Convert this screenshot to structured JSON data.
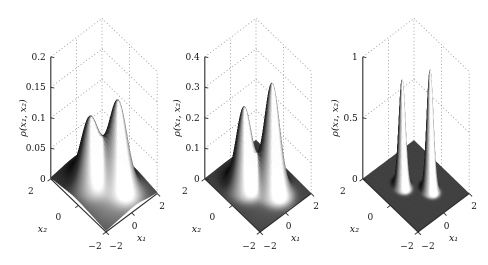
{
  "figure": {
    "background": "#ffffff",
    "panels": 3
  },
  "style": {
    "axis_color": "#2b2b2b",
    "grid_color": "#909090",
    "text_color": "#111111",
    "surface_highlight": "#ffffff",
    "surface_shadow": "#0d0d0d"
  },
  "chart_data": [
    {
      "type": "surface",
      "id": "panel-1",
      "z_axis": {
        "label": "ρ(x₁, x₂)",
        "min": 0,
        "max": 0.2,
        "ticks": [
          {
            "value": 0,
            "label": "0"
          },
          {
            "value": 0.05,
            "label": "0.05"
          },
          {
            "value": 0.1,
            "label": "0.1"
          },
          {
            "value": 0.15,
            "label": "0.15"
          },
          {
            "value": 0.2,
            "label": "0.2"
          }
        ]
      },
      "x1_axis": {
        "label": "x₁",
        "min": -2,
        "max": 2,
        "ticks": [
          {
            "value": -2,
            "label": "−2"
          },
          {
            "value": 0,
            "label": "0"
          },
          {
            "value": 2,
            "label": "2"
          }
        ]
      },
      "x2_axis": {
        "label": "x₂",
        "min": -2,
        "max": 2,
        "ticks": [
          {
            "value": -2,
            "label": "−2"
          },
          {
            "value": 0,
            "label": "0"
          },
          {
            "value": 2,
            "label": "2"
          }
        ]
      },
      "grid": "dotted-back-walls",
      "surface": {
        "model": "gaussian-mixture",
        "sigma": 0.47,
        "modes": [
          {
            "x1": -0.6,
            "x2": 0.45,
            "amp": 0.095
          },
          {
            "x1": 0.45,
            "x2": -0.6,
            "amp": 0.128
          }
        ],
        "broad_base": {
          "amp": 0.022,
          "sigma": 1.3
        },
        "peak_values": [
          0.113,
          0.146
        ],
        "saddle_value": 0.085
      }
    },
    {
      "type": "surface",
      "id": "panel-2",
      "z_axis": {
        "label": "ρ(x₁, x₂)",
        "min": 0,
        "max": 0.4,
        "ticks": [
          {
            "value": 0,
            "label": "0"
          },
          {
            "value": 0.1,
            "label": "0.1"
          },
          {
            "value": 0.2,
            "label": "0.2"
          },
          {
            "value": 0.3,
            "label": "0.3"
          },
          {
            "value": 0.4,
            "label": "0.4"
          }
        ]
      },
      "x1_axis": {
        "label": "x₁",
        "min": -2,
        "max": 2,
        "ticks": [
          {
            "value": -2,
            "label": "−2"
          },
          {
            "value": 0,
            "label": "0"
          },
          {
            "value": 2,
            "label": "2"
          }
        ]
      },
      "x2_axis": {
        "label": "x₂",
        "min": -2,
        "max": 2,
        "ticks": [
          {
            "value": -2,
            "label": "−2"
          },
          {
            "value": 0,
            "label": "0"
          },
          {
            "value": 2,
            "label": "2"
          }
        ]
      },
      "grid": "dotted-back-walls",
      "surface": {
        "model": "gaussian-mixture",
        "sigma": 0.4,
        "modes": [
          {
            "x1": -0.6,
            "x2": 0.45,
            "amp": 0.25
          },
          {
            "x1": 0.45,
            "x2": -0.6,
            "amp": 0.34
          }
        ],
        "broad_base": {
          "amp": 0.012,
          "sigma": 1.2
        },
        "peak_values": [
          0.26,
          0.35
        ],
        "saddle_value": 0.12
      }
    },
    {
      "type": "surface",
      "id": "panel-3",
      "z_axis": {
        "label": "ρ(x₁, x₂)",
        "min": 0,
        "max": 1,
        "ticks": [
          {
            "value": 0,
            "label": "0"
          },
          {
            "value": 0.5,
            "label": "0.5"
          },
          {
            "value": 1,
            "label": "1"
          }
        ]
      },
      "x1_axis": {
        "label": "x₁",
        "min": -2,
        "max": 2,
        "ticks": [
          {
            "value": -2,
            "label": "−2"
          },
          {
            "value": 0,
            "label": "0"
          },
          {
            "value": 2,
            "label": "2"
          }
        ]
      },
      "x2_axis": {
        "label": "x₂",
        "min": -2,
        "max": 2,
        "ticks": [
          {
            "value": -2,
            "label": "−2"
          },
          {
            "value": 0,
            "label": "0"
          },
          {
            "value": 2,
            "label": "2"
          }
        ]
      },
      "grid": "dotted-back-walls",
      "surface": {
        "model": "gaussian-mixture",
        "sigma": 0.17,
        "modes": [
          {
            "x1": -0.6,
            "x2": 0.45,
            "amp": 0.88
          },
          {
            "x1": 0.45,
            "x2": -0.6,
            "amp": 0.99
          }
        ],
        "broad_base": null,
        "peak_values": [
          0.88,
          0.99
        ],
        "saddle_value": 0.0
      }
    }
  ]
}
